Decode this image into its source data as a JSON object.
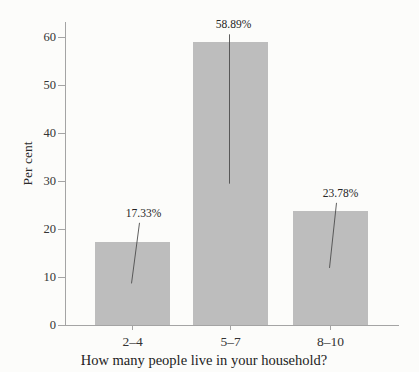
{
  "chart_data": {
    "type": "bar",
    "title": "",
    "xlabel": "How many people live in your household?",
    "ylabel": "Per cent",
    "categories": [
      "2–4",
      "5–7",
      "8–10"
    ],
    "values": [
      17.33,
      58.89,
      23.78
    ],
    "value_labels": [
      "17.33%",
      "58.89%",
      "23.78%"
    ],
    "yticks": [
      0,
      10,
      20,
      30,
      40,
      50,
      60
    ],
    "ylim": [
      0,
      60
    ],
    "grid": false,
    "legend": "none",
    "annotation_style": "leader-lines-to-bar-midpoint",
    "bar_color": "#bdbdbd",
    "axis_color": "#a4a4a4",
    "text_color": "#2f2f2f",
    "leader_line_color": "#4d4d4d",
    "background_color": "#fcfcfa"
  }
}
